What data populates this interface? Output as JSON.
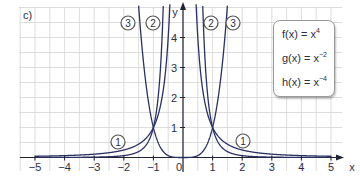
{
  "figure": {
    "part_label": "c)"
  },
  "chart_data": {
    "type": "line",
    "title": "",
    "xlabel": "x",
    "ylabel": "y",
    "xlim": [
      -5,
      5
    ],
    "ylim": [
      0,
      5
    ],
    "grid": true,
    "x_ticks": [
      "-5",
      "-4",
      "-3",
      "-2",
      "-1",
      "0",
      "1",
      "2",
      "3",
      "4",
      "5"
    ],
    "y_ticks": [
      "1",
      "2",
      "3",
      "4"
    ],
    "legend_position": "upper right (boxed)",
    "series": [
      {
        "name": "f(x) = x^4",
        "marker": "1",
        "formula": "x^4"
      },
      {
        "name": "g(x) = x^-2",
        "marker": "2",
        "formula": "x^-2"
      },
      {
        "name": "h(x) = x^-4",
        "marker": "3",
        "formula": "x^-4"
      }
    ],
    "curve_labels": [
      {
        "text": "1",
        "x": -2.2,
        "y": 0.5
      },
      {
        "text": "1",
        "x": 2.0,
        "y": 0.5
      },
      {
        "text": "2",
        "x": -1.0,
        "y": 4.5
      },
      {
        "text": "2",
        "x": 0.95,
        "y": 4.5
      },
      {
        "text": "3",
        "x": -1.8,
        "y": 4.5
      },
      {
        "text": "3",
        "x": 1.7,
        "y": 4.5
      }
    ],
    "intersections": [
      [
        -1,
        1
      ],
      [
        1,
        1
      ]
    ]
  },
  "legend": {
    "items": [
      {
        "prefix": "f(x) = x",
        "exp": "4"
      },
      {
        "prefix": "g(x) = x",
        "exp": "−2"
      },
      {
        "prefix": "h(x) = x",
        "exp": "−4"
      }
    ]
  },
  "colors": {
    "curve": "#2b3163",
    "grid": "#d4d4d4",
    "axis": "#1f2333"
  }
}
